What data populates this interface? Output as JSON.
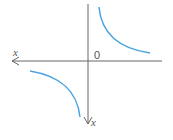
{
  "diagram": {
    "type": "hyperbola-graph",
    "axes": {
      "horizontal_label": "x",
      "vertical_label": "x",
      "origin_label": "0"
    },
    "curve_color": "#4aa3df",
    "axis_color": "#666666",
    "branches": [
      "upper-right",
      "lower-left"
    ]
  }
}
